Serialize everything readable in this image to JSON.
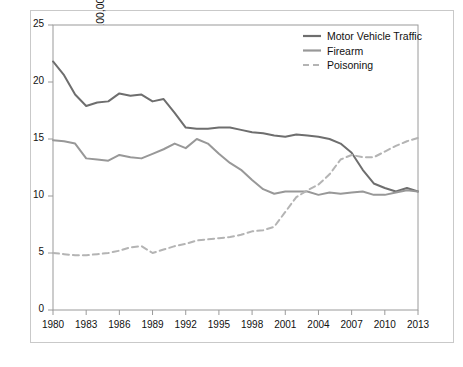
{
  "chart_data": {
    "type": "line",
    "title": "",
    "subtitle": "",
    "xlabel": "Year",
    "ylabel": "Rate per 100,000 Population",
    "xlim": [
      1980,
      2013
    ],
    "ylim": [
      0,
      25
    ],
    "ytick_step": 5,
    "xtick_step": 3,
    "grid": false,
    "legend_position": "top-right",
    "x": [
      1980,
      1981,
      1982,
      1983,
      1984,
      1985,
      1986,
      1987,
      1988,
      1989,
      1990,
      1991,
      1992,
      1993,
      1994,
      1995,
      1996,
      1997,
      1998,
      1999,
      2000,
      2001,
      2002,
      2003,
      2004,
      2005,
      2006,
      2007,
      2008,
      2009,
      2010,
      2011,
      2012,
      2013
    ],
    "xticks": [
      "1980",
      "1983",
      "1986",
      "1989",
      "1992",
      "1995",
      "1998",
      "2001",
      "2004",
      "2007",
      "2010",
      "2013"
    ],
    "yticks": [
      "0",
      "5",
      "10",
      "15",
      "20",
      "25"
    ],
    "series": [
      {
        "name": "Motor Vehicle Traffic",
        "color": "#6e6e6e",
        "style": "solid",
        "width": 2.0,
        "values": [
          21.8,
          20.6,
          18.9,
          17.9,
          18.2,
          18.3,
          19.0,
          18.8,
          18.9,
          18.3,
          18.5,
          17.3,
          16.0,
          15.9,
          15.9,
          16.0,
          16.0,
          15.8,
          15.6,
          15.5,
          15.3,
          15.2,
          15.4,
          15.3,
          15.2,
          15.0,
          14.6,
          13.8,
          12.3,
          11.1,
          10.7,
          10.4,
          10.7,
          10.4
        ]
      },
      {
        "name": "Firearm",
        "color": "#989898",
        "style": "solid",
        "width": 2.0,
        "values": [
          14.9,
          14.8,
          14.6,
          13.3,
          13.2,
          13.1,
          13.6,
          13.4,
          13.3,
          13.7,
          14.1,
          14.6,
          14.2,
          15.0,
          14.6,
          13.7,
          12.9,
          12.3,
          11.4,
          10.6,
          10.2,
          10.4,
          10.4,
          10.4,
          10.1,
          10.3,
          10.2,
          10.3,
          10.4,
          10.1,
          10.1,
          10.3,
          10.5,
          10.4
        ]
      },
      {
        "name": "Poisoning",
        "color": "#b4b4b4",
        "style": "dashed",
        "width": 2.0,
        "values": [
          5.0,
          4.9,
          4.8,
          4.8,
          4.9,
          5.0,
          5.2,
          5.5,
          5.6,
          5.0,
          5.3,
          5.6,
          5.8,
          6.1,
          6.2,
          6.3,
          6.4,
          6.6,
          6.9,
          7.0,
          7.3,
          8.6,
          9.9,
          10.5,
          11.0,
          11.9,
          13.2,
          13.6,
          13.4,
          13.4,
          13.9,
          14.4,
          14.8,
          15.1
        ]
      }
    ],
    "legend": [
      {
        "label": "Motor Vehicle Traffic",
        "color": "#6e6e6e",
        "style": "solid"
      },
      {
        "label": "Firearm",
        "color": "#989898",
        "style": "solid"
      },
      {
        "label": "Poisoning",
        "color": "#b4b4b4",
        "style": "dashed"
      }
    ]
  }
}
